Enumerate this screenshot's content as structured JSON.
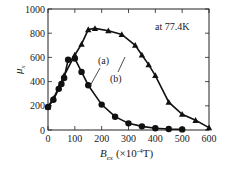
{
  "chart_data": {
    "type": "line",
    "title": "",
    "xlabel": "B_ex (×10^-4 T)",
    "ylabel": "μ_x",
    "xlim": [
      0,
      600
    ],
    "ylim": [
      0,
      1000
    ],
    "xticks": [
      0,
      100,
      200,
      300,
      400,
      500,
      600
    ],
    "yticks": [
      0,
      200,
      400,
      600,
      800,
      1000
    ],
    "grid": false,
    "annotation": "at 77.4K",
    "series": [
      {
        "name": "(a)",
        "marker": "circle",
        "x": [
          0,
          20,
          40,
          50,
          60,
          75,
          100,
          125,
          150,
          200,
          250,
          300,
          350,
          400,
          450,
          500
        ],
        "y": [
          190,
          250,
          340,
          380,
          430,
          580,
          590,
          480,
          370,
          210,
          110,
          55,
          30,
          15,
          8,
          5
        ]
      },
      {
        "name": "(b)",
        "marker": "triangle",
        "x": [
          0,
          20,
          40,
          60,
          100,
          125,
          150,
          175,
          225,
          275,
          325,
          350,
          375,
          400,
          450,
          500,
          550,
          600
        ],
        "y": [
          190,
          260,
          350,
          450,
          620,
          710,
          830,
          840,
          820,
          790,
          700,
          620,
          540,
          450,
          230,
          130,
          80,
          20
        ]
      }
    ]
  },
  "labels": {
    "ylabel_main": "μ",
    "ylabel_sub": "x",
    "xlabel_main": "B",
    "xlabel_sub": "ex",
    "xlabel_unit": "(×10",
    "xlabel_exp": "-4",
    "xlabel_end": "T)",
    "annotation": "at 77.4K",
    "series_a": "(a)",
    "series_b": "(b)"
  }
}
